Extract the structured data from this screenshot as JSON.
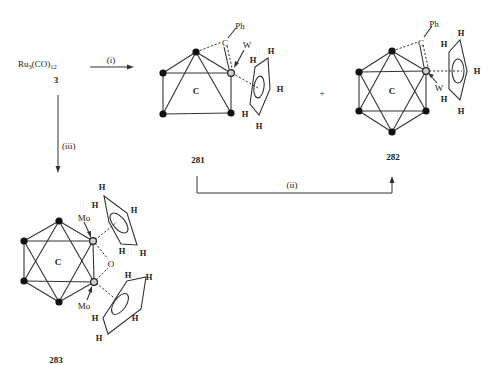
{
  "reactant": {
    "formula_main": "Ru",
    "formula_sub1": "3",
    "formula_mid": "(CO)",
    "formula_sub2": "12",
    "number": "3"
  },
  "steps": {
    "i": "(i)",
    "ii": "(ii)",
    "iii": "(iii)"
  },
  "plus": "+",
  "compounds": [
    {
      "id": "281",
      "cluster_label": "C",
      "metal": "W",
      "substituent": "Ph",
      "bridge_atom": "C",
      "ring_H": [
        "H",
        "H",
        "H",
        "H",
        "H"
      ]
    },
    {
      "id": "282",
      "cluster_label": "C",
      "metal": "W",
      "substituent": "Ph",
      "bridge_atom": "C",
      "ring_H": [
        "H",
        "H",
        "H",
        "H",
        "H"
      ]
    },
    {
      "id": "283",
      "cluster_label": "C",
      "metals": [
        "Mo",
        "Mo"
      ],
      "bridge_atom": "O",
      "ring1_H": [
        "H",
        "H",
        "H",
        "H",
        "H"
      ],
      "ring2_H": [
        "H",
        "H",
        "H",
        "H",
        "H"
      ]
    }
  ]
}
